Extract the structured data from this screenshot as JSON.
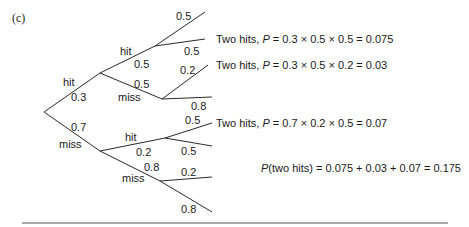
{
  "part_label": "(c)",
  "tree": {
    "level1": {
      "hit": {
        "label": "hit",
        "prob": "0.3"
      },
      "miss": {
        "label": "miss",
        "prob": "0.7"
      }
    },
    "level2_after_hit": {
      "hit": {
        "label": "hit",
        "prob": "0.5"
      },
      "miss": {
        "label": "miss",
        "prob": "0.5"
      }
    },
    "level2_after_miss": {
      "hit": {
        "label": "hit",
        "prob": "0.2"
      },
      "miss": {
        "label": "miss",
        "prob": "0.8"
      }
    },
    "level3_hit_hit": {
      "upper": "0.5",
      "lower": "0.5"
    },
    "level3_hit_miss": {
      "upper": "0.2",
      "lower": "0.8"
    },
    "level3_miss_hit": {
      "upper": "0.5",
      "lower": "0.5"
    },
    "level3_miss_miss": {
      "upper": "0.2",
      "lower": "0.8"
    }
  },
  "results": [
    {
      "prefix": "Two hits, ",
      "var": "P",
      "expr": " = 0.3 × 0.5 × 0.5 = 0.075"
    },
    {
      "prefix": "Two hits, ",
      "var": "P",
      "expr": " = 0.3 × 0.5 × 0.2 = 0.03"
    },
    {
      "prefix": "Two hits, ",
      "var": "P",
      "expr": " = 0.7 × 0.2 × 0.5 = 0.07"
    }
  ],
  "total": {
    "var": "P",
    "expr": "(two hits) = 0.075 + 0.03 + 0.07 = 0.175"
  }
}
